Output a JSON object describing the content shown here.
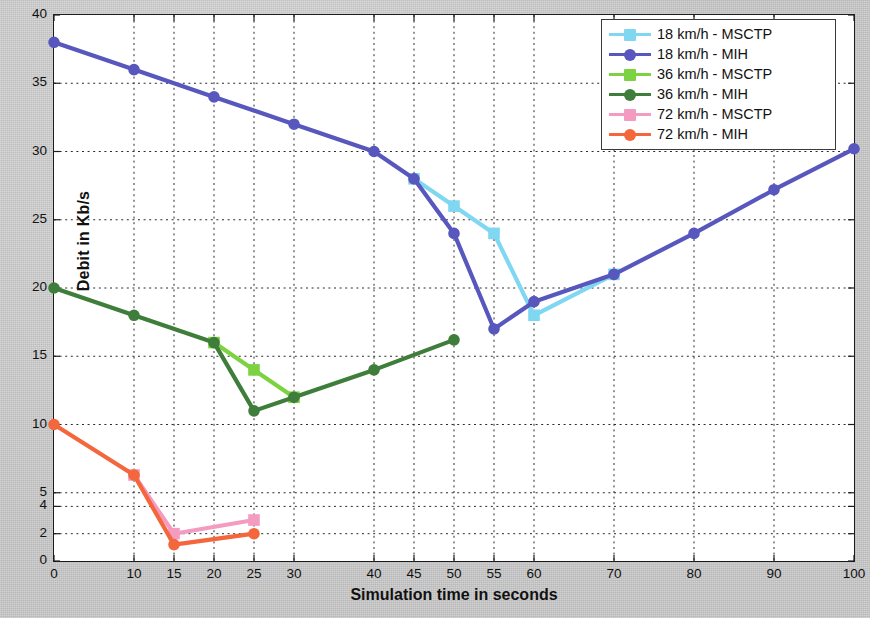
{
  "chart_data": {
    "type": "line",
    "title": "",
    "xlabel": "Simulation time in seconds",
    "ylabel": "Debit in Kb/s",
    "xlim": [
      0,
      100
    ],
    "ylim": [
      0,
      40
    ],
    "grid": true,
    "legend_position": "top-right",
    "xticks": [
      0,
      10,
      15,
      20,
      25,
      30,
      40,
      45,
      50,
      55,
      60,
      70,
      80,
      90,
      100
    ],
    "xticklabels": [
      "0",
      "10",
      "15",
      "20",
      "25",
      "30",
      "40",
      "45",
      "50",
      "55",
      "60",
      "70",
      "80",
      "90",
      "100"
    ],
    "yticks": [
      0,
      2,
      4,
      5,
      10,
      15,
      20,
      25,
      30,
      35,
      40
    ],
    "yticklabels": [
      "0",
      "2",
      "4",
      "5",
      "10",
      "15",
      "20",
      "25",
      "30",
      "35",
      "40"
    ],
    "series": [
      {
        "name": "18 km/h - MSCTP",
        "color": "#7FD7F2",
        "marker": "square",
        "x": [
          45,
          50,
          55,
          60,
          70
        ],
        "y": [
          28,
          26,
          24,
          18,
          21
        ]
      },
      {
        "name": "18 km/h - MIH",
        "color": "#5757BE",
        "marker": "circle",
        "x": [
          0,
          10,
          20,
          30,
          40,
          45,
          50,
          55,
          60,
          70,
          80,
          90,
          100
        ],
        "y": [
          38,
          36,
          34,
          32,
          30,
          28,
          24,
          17,
          19,
          21,
          24,
          27.2,
          30.2
        ]
      },
      {
        "name": "36 km/h - MSCTP",
        "color": "#7CD240",
        "marker": "square",
        "x": [
          20,
          25,
          30
        ],
        "y": [
          16,
          14,
          12
        ]
      },
      {
        "name": "36 km/h - MIH",
        "color": "#3F7D3B",
        "marker": "circle",
        "x": [
          0,
          10,
          20,
          25,
          30,
          40,
          50
        ],
        "y": [
          20,
          18,
          16,
          11,
          12,
          14,
          16.2
        ]
      },
      {
        "name": "72 km/h - MSCTP",
        "color": "#F49BC1",
        "marker": "square",
        "x": [
          10,
          15,
          25
        ],
        "y": [
          6.3,
          2,
          3
        ]
      },
      {
        "name": "72 km/h - MIH",
        "color": "#F4663C",
        "marker": "circle",
        "x": [
          0,
          10,
          15,
          25
        ],
        "y": [
          10,
          6.3,
          1.2,
          2
        ]
      }
    ]
  },
  "legend": {
    "items": [
      {
        "label": "18 km/h - MSCTP",
        "color": "#7FD7F2",
        "marker": "square"
      },
      {
        "label": "18 km/h - MIH",
        "color": "#5757BE",
        "marker": "circle"
      },
      {
        "label": "36 km/h - MSCTP",
        "color": "#7CD240",
        "marker": "square"
      },
      {
        "label": "36 km/h - MIH",
        "color": "#3F7D3B",
        "marker": "circle"
      },
      {
        "label": "72 km/h - MSCTP",
        "color": "#F49BC1",
        "marker": "square"
      },
      {
        "label": "72 km/h - MIH",
        "color": "#F4663C",
        "marker": "circle"
      }
    ]
  }
}
